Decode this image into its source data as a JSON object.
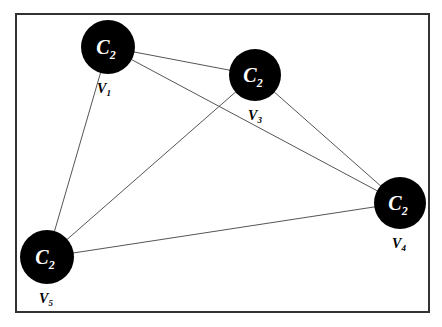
{
  "diagram": {
    "frame": {
      "x": 16,
      "y": 14,
      "w": 413,
      "h": 298
    },
    "node_fill": "#000000",
    "node_text_color": "#ffffff",
    "edge_color": "#555555",
    "nodes": [
      {
        "id": "n1",
        "cx": 108,
        "cy": 47,
        "r": 27,
        "name": "C",
        "sub": "2",
        "label": "V",
        "label_sub": "1",
        "lx": 104,
        "ly": 93
      },
      {
        "id": "n2",
        "cx": 255,
        "cy": 75,
        "r": 26,
        "name": "C",
        "sub": "2",
        "label": "V",
        "label_sub": "3",
        "lx": 255,
        "ly": 120
      },
      {
        "id": "n3",
        "cx": 400,
        "cy": 203,
        "r": 26,
        "name": "C",
        "sub": "2",
        "label": "V",
        "label_sub": "4",
        "lx": 399,
        "ly": 248
      },
      {
        "id": "n4",
        "cx": 47,
        "cy": 257,
        "r": 27,
        "name": "C",
        "sub": "2",
        "label": "V",
        "label_sub": "5",
        "lx": 46,
        "ly": 303
      }
    ],
    "edges": [
      [
        "n1",
        "n2"
      ],
      [
        "n1",
        "n3"
      ],
      [
        "n1",
        "n4"
      ],
      [
        "n2",
        "n3"
      ],
      [
        "n2",
        "n4"
      ],
      [
        "n4",
        "n3"
      ]
    ]
  }
}
